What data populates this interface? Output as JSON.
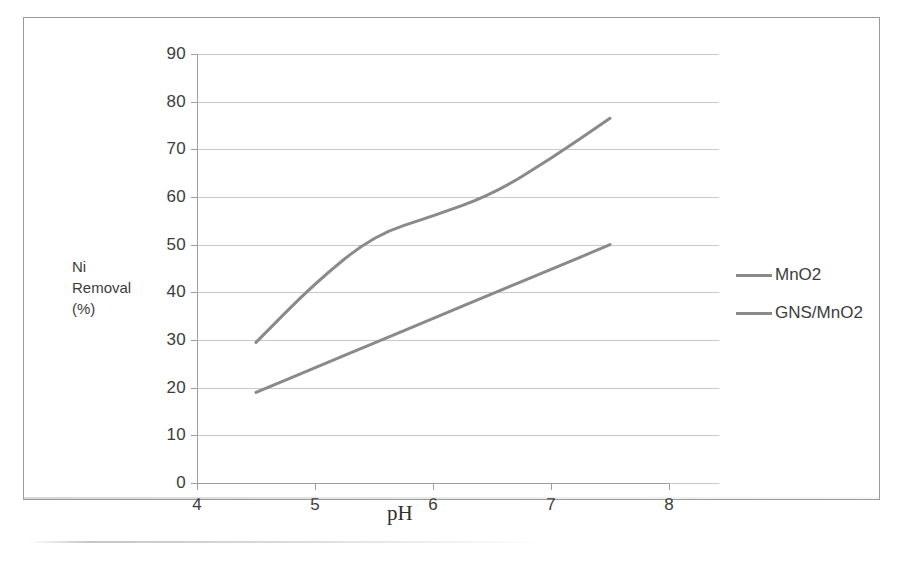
{
  "chart_data": {
    "type": "line",
    "title": "",
    "subtitle": "",
    "xlabel": "pH",
    "ylabel": "Ni Removal (%)",
    "ylabel_lines": [
      "Ni",
      "Removal",
      "(%)"
    ],
    "xlim": [
      4,
      8
    ],
    "ylim": [
      0,
      90
    ],
    "x_ticks": [
      "4",
      "5",
      "6",
      "7",
      "8"
    ],
    "x_tick_values": [
      4,
      5,
      6,
      7,
      8
    ],
    "y_ticks": [
      "0",
      "10",
      "20",
      "30",
      "40",
      "50",
      "60",
      "70",
      "80",
      "90"
    ],
    "y_tick_values": [
      0,
      10,
      20,
      30,
      40,
      50,
      60,
      70,
      80,
      90
    ],
    "grid": "horizontal",
    "legend_position": "right",
    "series": [
      {
        "name": "MnO2",
        "color": "#8a8a8a",
        "x": [
          4.5,
          5.0,
          5.5,
          6.0,
          6.5,
          7.0,
          7.5
        ],
        "values": [
          29.5,
          42.0,
          52.0,
          56.0,
          60.5,
          68.0,
          76.5
        ]
      },
      {
        "name": "GNS/MnO2",
        "color": "#8a8a8a",
        "x": [
          4.5,
          5.0,
          5.5,
          6.0,
          6.5,
          7.0,
          7.5
        ],
        "values": [
          19.0,
          24.2,
          29.3,
          34.5,
          39.7,
          44.8,
          50.0
        ]
      }
    ],
    "annotations": []
  },
  "legend": {
    "items": [
      {
        "label": "MnO2"
      },
      {
        "label": "GNS/MnO2"
      }
    ]
  },
  "colors": {
    "series_line": "#8a8a8a",
    "gridline": "#c9c9c9",
    "axis": "#9f9f9f",
    "text": "#3c3c3c",
    "frame": "#9a9a9a",
    "background": "#ffffff"
  }
}
